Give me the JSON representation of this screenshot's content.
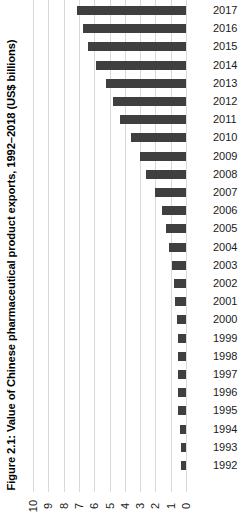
{
  "figure": {
    "title": "Figure 2.1: Value of Chinese pharmaceutical product exports, 1992–2018 (US$ billions)"
  },
  "chart_data": {
    "type": "bar",
    "orientation": "horizontal",
    "title": "Figure 2.1: Value of Chinese pharmaceutical product exports, 1992–2018 (US$ billions)",
    "xlabel": "",
    "ylabel": "US$ billions",
    "xlim": [
      0,
      10
    ],
    "ylim": [
      0,
      10
    ],
    "grid": true,
    "legend": false,
    "bar_color": "#3f3f3f",
    "gridline_color": "#d9d9d9",
    "axis_direction": "value axis reversed: 10 at left, 0 at right",
    "tick_labels": [
      "10",
      "9",
      "8",
      "7",
      "6",
      "5",
      "4",
      "3",
      "2",
      "1",
      "0"
    ],
    "tick_values": [
      10,
      9,
      8,
      7,
      6,
      5,
      4,
      3,
      2,
      1,
      0
    ],
    "categories": [
      "2017",
      "2016",
      "2015",
      "2014",
      "2013",
      "2012",
      "2011",
      "2010",
      "2009",
      "2008",
      "2007",
      "2006",
      "2005",
      "2004",
      "2003",
      "2002",
      "2001",
      "2000",
      "1999",
      "1998",
      "1997",
      "1996",
      "1995",
      "1994",
      "1993",
      "1992"
    ],
    "values": [
      7.1,
      6.7,
      6.4,
      5.9,
      5.2,
      4.8,
      4.3,
      3.6,
      3.0,
      2.6,
      2.0,
      1.6,
      1.3,
      1.1,
      0.9,
      0.8,
      0.7,
      0.6,
      0.55,
      0.55,
      0.55,
      0.5,
      0.5,
      0.4,
      0.35,
      0.3
    ],
    "series": [
      {
        "name": "Chinese pharmaceutical product exports",
        "values": [
          7.1,
          6.7,
          6.4,
          5.9,
          5.2,
          4.8,
          4.3,
          3.6,
          3.0,
          2.6,
          2.0,
          1.6,
          1.3,
          1.1,
          0.9,
          0.8,
          0.7,
          0.6,
          0.55,
          0.55,
          0.55,
          0.5,
          0.5,
          0.4,
          0.35,
          0.3
        ]
      }
    ]
  }
}
